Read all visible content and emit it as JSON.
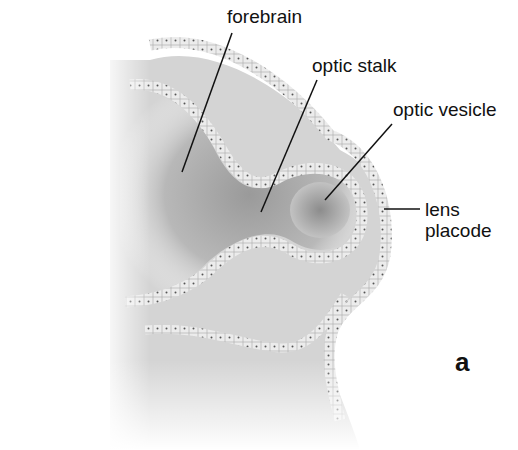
{
  "figure": {
    "panel_letter": "a",
    "labels": [
      {
        "id": "forebrain",
        "text": "forebrain"
      },
      {
        "id": "optic-stalk",
        "text": "optic stalk"
      },
      {
        "id": "optic-vesicle",
        "text": "optic vesicle"
      },
      {
        "id": "lens-placode-1",
        "text": "lens"
      },
      {
        "id": "lens-placode-2",
        "text": "placode"
      }
    ],
    "colors": {
      "background": "#ffffff",
      "tissue_dark": "#8a8a8a",
      "tissue_light": "#d9d9d9",
      "epithelium": "#ebebeb",
      "cell_dot": "#555555",
      "leader_line": "#111111"
    }
  }
}
